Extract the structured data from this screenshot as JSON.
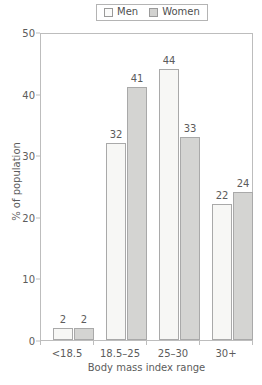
{
  "chart_data": {
    "type": "bar",
    "title": "",
    "categories": [
      "<18.5",
      "18.5–25",
      "25–30",
      "30+"
    ],
    "series": [
      {
        "name": "Men",
        "values": [
          2,
          32,
          44,
          22
        ],
        "color": "#f7f7f5",
        "swatch": "men-swatch"
      },
      {
        "name": "Women",
        "values": [
          2,
          41,
          33,
          24
        ],
        "color": "#d4d4d2",
        "swatch": "women-swatch"
      }
    ],
    "xlabel": "Body mass index range",
    "ylabel": "% of population",
    "ylim": [
      0,
      50
    ],
    "yticks": [
      0,
      10,
      20,
      30,
      40,
      50
    ],
    "ytick_labels": [
      "0",
      "10",
      "20",
      "30",
      "40",
      "50"
    ],
    "grid": false,
    "legend_position": "top-center",
    "data_labels": true
  },
  "legend": {
    "entries": [
      {
        "label": "Men"
      },
      {
        "label": "Women"
      }
    ]
  },
  "axes": {
    "y_title": "% of population",
    "x_title": "Body mass index range"
  }
}
